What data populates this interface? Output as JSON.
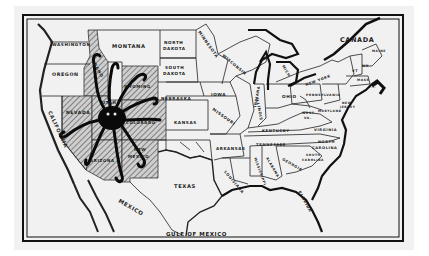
{
  "map": {
    "title": "United States political cartoon map — octopus over the Mountain West",
    "colors": {
      "background": "#ffffff",
      "paper": "#f1f1f1",
      "ink": "#111111",
      "hatch": "#6a6a6a"
    },
    "frame": {
      "style": "double-line border"
    },
    "region_labels": {
      "canada": "CANADA",
      "mexico": "MEXICO",
      "gulf": "GULF OF MEXICO"
    },
    "state_labels": {
      "washington": "WASHINGTON",
      "oregon": "OREGON",
      "california": "CALIFORNIA",
      "nevada": "NEVADA",
      "idaho": "IDAHO",
      "montana": "MONTANA",
      "wyoming": "WYOMING",
      "utah": "UTAH",
      "colorado": "COLORADO",
      "arizona": "ARIZONA",
      "new_mexico_1": "NEW",
      "new_mexico_2": "MEXICO",
      "north_dakota_1": "NORTH",
      "north_dakota_2": "DAKOTA",
      "south_dakota_1": "SOUTH",
      "south_dakota_2": "DAKOTA",
      "nebraska": "NEBRASKA",
      "kansas": "KANSAS",
      "texas": "TEXAS",
      "minnesota": "MINNESOTA",
      "iowa": "IOWA",
      "missouri": "MISSOURI",
      "arkansas": "ARKANSAS",
      "louisiana": "LOUISIANA",
      "wisconsin": "WISCONSIN",
      "illinois": "ILLINOIS",
      "indiana": "INDIANA",
      "michigan": "MICH",
      "ohio": "OHIO",
      "kentucky": "KENTUCKY",
      "tennessee": "TENNESSEE",
      "mississippi": "MISSISSIPPI",
      "alabama": "ALABAMA",
      "georgia": "GEORGIA",
      "florida": "FLORIDA",
      "south_carolina_1": "SOUTH",
      "south_carolina_2": "CAROLINA",
      "north_carolina_1": "NORTH",
      "north_carolina_2": "CAROLINA",
      "virginia": "VIRGINIA",
      "west_virginia_1": "WEST",
      "west_virginia_2": "VA.",
      "maryland": "MARYLAND",
      "new_jersey_1": "NEW",
      "new_jersey_2": "JERSEY",
      "pennsylvania": "PENNSYLVANIA",
      "new_york": "NEW YORK",
      "vermont": "VT",
      "new_hampshire": "NH",
      "massachusetts": "MASS",
      "rhode_island": "R.I.",
      "maine": "MAINE"
    },
    "highlighted_states": [
      "Idaho",
      "Wyoming",
      "Utah",
      "Nevada",
      "Colorado",
      "Arizona",
      "New Mexico"
    ],
    "figure": {
      "name": "octopus",
      "centered_on": "Utah",
      "tentacles": 9
    }
  }
}
